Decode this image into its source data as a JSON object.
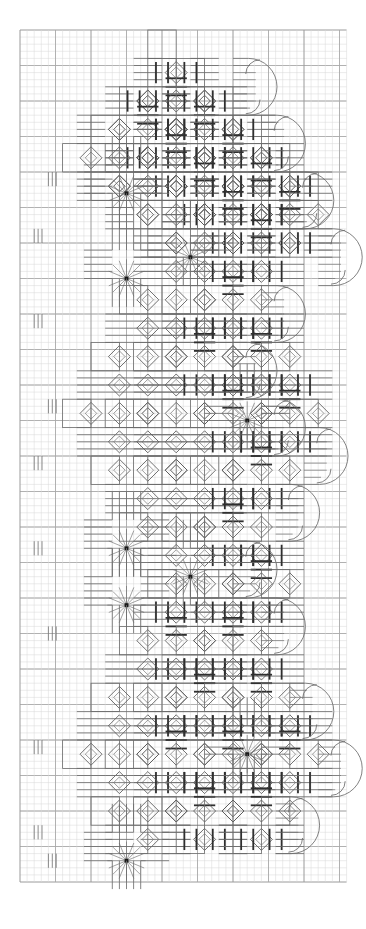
{
  "document": {
    "title": "Hardanger Embroidery Pattern Chart",
    "type": "needlework-chart",
    "description": "Counted-thread Hardanger whitework chart on graph paper showing a diagonal band of diamond motifs with kloster blocks, eyelets, satin-stitch bars, woven spider-web wheels and a scalloped picot edge."
  },
  "canvas": {
    "width": 366,
    "height": 929,
    "background": "#ffffff"
  },
  "grid": {
    "origin_x": 20,
    "origin_y": 30,
    "cell": 7.1,
    "cols": 46,
    "rows": 120,
    "minor_color": "#d8d8d8",
    "minor_width": 0.5,
    "major_color": "#a8a8a8",
    "major_width": 0.9,
    "major_every": 5,
    "heavy_color": "#9a9a9a",
    "heavy_width": 1.0,
    "heavy_every": 10
  },
  "palette": {
    "stitch_light": "#6e6e6e",
    "stitch_mid": "#555555",
    "stitch_dark": "#2f2f2f",
    "eyelet": "#5a5a5a",
    "star": "#6a6a6a",
    "star_center": "#1a1a1a",
    "outline": "#6b6b6b"
  },
  "legend_semantics": {
    "kloster_block": "group of 5 parallel satin stitches over 4 threads",
    "satin_bar": "heavy dark satin stitch bar",
    "eyelet": "open diamond / algerian eye",
    "spider_wheel": "woven wheel with 16 radiating spokes and filled centre",
    "picot_arc": "quarter-circle picot on scalloped outer edge"
  },
  "chart_data": {
    "type": "scatter",
    "title": "Hardanger Embroidery Pattern Chart",
    "xlabel": "",
    "ylabel": "",
    "grid": true,
    "legend": "none",
    "units": "grid cells (1 cell = 2 fabric threads)",
    "kloster_blocks": [
      {
        "cx": 22,
        "cy": 4,
        "dir": "h"
      },
      {
        "cx": 22,
        "cy": 5,
        "dir": "h"
      },
      {
        "cx": 18,
        "cy": 8,
        "dir": "h"
      },
      {
        "cx": 26,
        "cy": 8,
        "dir": "v"
      },
      {
        "cx": 14,
        "cy": 12,
        "dir": "h"
      },
      {
        "cx": 22,
        "cy": 12,
        "dir": "h"
      },
      {
        "cx": 30,
        "cy": 12,
        "dir": "v"
      },
      {
        "cx": 10,
        "cy": 16,
        "dir": "h"
      },
      {
        "cx": 18,
        "cy": 16,
        "dir": "h"
      },
      {
        "cx": 26,
        "cy": 16,
        "dir": "h"
      },
      {
        "cx": 34,
        "cy": 16,
        "dir": "v"
      },
      {
        "cx": 6,
        "cy": 20,
        "dir": "h"
      },
      {
        "cx": 14,
        "cy": 20,
        "dir": "h"
      },
      {
        "cx": 22,
        "cy": 20,
        "dir": "h"
      },
      {
        "cx": 30,
        "cy": 20,
        "dir": "h"
      },
      {
        "cx": 38,
        "cy": 20,
        "dir": "v"
      },
      {
        "cx": 10,
        "cy": 24,
        "dir": "h"
      },
      {
        "cx": 18,
        "cy": 24,
        "dir": "h"
      },
      {
        "cx": 26,
        "cy": 24,
        "dir": "h"
      },
      {
        "cx": 34,
        "cy": 24,
        "dir": "h"
      },
      {
        "cx": 14,
        "cy": 28,
        "dir": "h"
      },
      {
        "cx": 22,
        "cy": 28,
        "dir": "h"
      },
      {
        "cx": 30,
        "cy": 28,
        "dir": "h"
      },
      {
        "cx": 18,
        "cy": 32,
        "dir": "h"
      },
      {
        "cx": 26,
        "cy": 32,
        "dir": "h"
      },
      {
        "cx": 22,
        "cy": 36,
        "dir": "h"
      }
    ],
    "spider_wheels": [
      {
        "x": 13,
        "y": 21,
        "r": 18,
        "spokes": 16
      },
      {
        "x": 22,
        "y": 30,
        "r": 18,
        "spokes": 16
      },
      {
        "x": 13,
        "y": 33,
        "r": 18,
        "spokes": 16
      },
      {
        "x": 30,
        "y": 53,
        "r": 18,
        "spokes": 16
      },
      {
        "x": 13,
        "y": 71,
        "r": 18,
        "spokes": 16
      },
      {
        "x": 22,
        "y": 75,
        "r": 18,
        "spokes": 16
      },
      {
        "x": 13,
        "y": 79,
        "r": 18,
        "spokes": 16
      },
      {
        "x": 30,
        "y": 100,
        "r": 18,
        "spokes": 16
      },
      {
        "x": 13,
        "y": 115,
        "r": 18,
        "spokes": 16
      }
    ]
  }
}
